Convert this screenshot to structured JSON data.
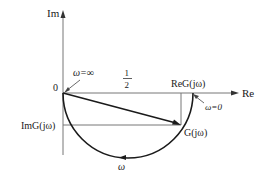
{
  "diagram": {
    "type": "nyquist-plot",
    "axes": {
      "imag_label": "Im",
      "real_label": "Re",
      "origin_label": "0"
    },
    "labels": {
      "omega_inf": "ω=∞",
      "omega_zero": "ω=0",
      "half_num": "1",
      "half_den": "2",
      "re_g": "ReG(jω)",
      "im_g": "ImG(jω)",
      "g_point": "G(jω)",
      "omega_dir": "ω"
    },
    "colors": {
      "curve": "#1a1a1a",
      "axis": "#6b6b6b"
    }
  }
}
